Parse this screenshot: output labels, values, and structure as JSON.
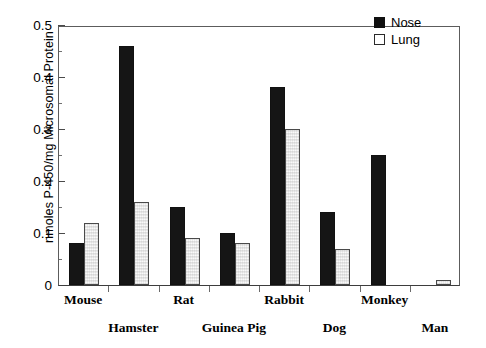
{
  "chart_data": {
    "type": "bar",
    "title": "",
    "subtitle": "",
    "xlabel": "",
    "ylabel": "nmoles P-450/mg Microsomal Protein",
    "ylim": [
      0,
      0.5
    ],
    "y_ticks": [
      "0",
      "0.1",
      "0.2",
      "0.3",
      "0.4",
      "0.5"
    ],
    "y_tick_values": [
      0,
      0.1,
      0.2,
      0.3,
      0.4,
      0.5
    ],
    "y_minor_tick_values": [
      0.05,
      0.15,
      0.25,
      0.35,
      0.45
    ],
    "grid": false,
    "legend_position": "top-right",
    "categories": [
      "Mouse",
      "Hamster",
      "Rat",
      "Guinea Pig",
      "Rabbit",
      "Dog",
      "Monkey",
      "Man"
    ],
    "series": [
      {
        "name": "Nose",
        "style": "filled",
        "color": "#151515",
        "values": [
          0.08,
          0.46,
          0.15,
          0.1,
          0.38,
          0.14,
          0.25,
          null
        ]
      },
      {
        "name": "Lung",
        "style": "hollow",
        "color": "#ffffff",
        "values": [
          0.12,
          0.16,
          0.09,
          0.08,
          0.3,
          0.07,
          null,
          0.01
        ]
      }
    ]
  },
  "legend": {
    "entries": [
      {
        "label": "Nose",
        "style": "filled"
      },
      {
        "label": "Lung",
        "style": "hollow"
      }
    ]
  },
  "axis": {
    "y_title": "nmoles P-450/mg Microsomal Protein"
  },
  "x_labels": [
    {
      "label": "Mouse",
      "row": "top"
    },
    {
      "label": "Hamster",
      "row": "bottom"
    },
    {
      "label": "Rat",
      "row": "top"
    },
    {
      "label": "Guinea Pig",
      "row": "bottom"
    },
    {
      "label": "Rabbit",
      "row": "top"
    },
    {
      "label": "Dog",
      "row": "bottom"
    },
    {
      "label": "Monkey",
      "row": "top"
    },
    {
      "label": "Man",
      "row": "bottom"
    }
  ]
}
